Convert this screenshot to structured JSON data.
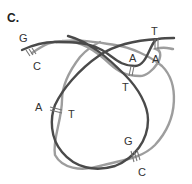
{
  "figure": {
    "panel_label": "C.",
    "colors": {
      "dark_strand": "#4a4a4a",
      "light_strand": "#9d9d9d",
      "bond": "#777777",
      "text": "#333333",
      "background": "#ffffff"
    },
    "base_pairs": [
      {
        "id": "top-left",
        "top": "G",
        "bottom": "C",
        "bonds": 3
      },
      {
        "id": "top-right",
        "top": "T",
        "bottom": "A",
        "bonds": 2
      },
      {
        "id": "upper-middle",
        "top": "A",
        "bottom": "T",
        "bonds": 2
      },
      {
        "id": "left",
        "top": "A",
        "bottom": "T",
        "bonds": 2
      },
      {
        "id": "bottom",
        "top": "G",
        "bottom": "C",
        "bonds": 3
      }
    ]
  }
}
